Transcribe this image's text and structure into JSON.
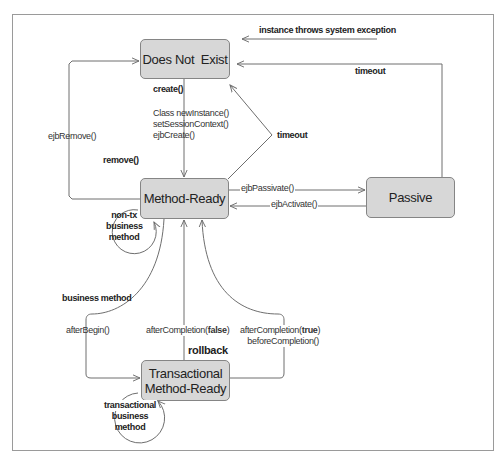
{
  "diagram": {
    "type": "state-diagram",
    "states": {
      "does_not_exist": "Does Not  Exist",
      "method_ready": "Method-Ready",
      "passive": "Passive",
      "transactional_line1": "Transactional",
      "transactional_line2": "Method-Ready"
    },
    "transitions": {
      "system_exception": "instance throws system exception",
      "timeout_passive": "timeout",
      "timeout_ready": "timeout",
      "create": "create()",
      "create_calls": [
        "Class newInstance()",
        "setSessionContext()",
        "ejbCreate()"
      ],
      "ejb_remove": "ejbRemove()",
      "remove": "remove()",
      "ejb_passivate": "ejbPassivate()",
      "ejb_activate": "ejbActivate()",
      "non_tx_loop": [
        "non-tx",
        "business",
        "method"
      ],
      "business_method": "business method",
      "after_begin": "afterBegin()",
      "after_completion_false_prefix": "afterCompletion(",
      "after_completion_false_value": "false",
      "after_completion_false_suffix": ")",
      "rollback": "rollback",
      "after_completion_true_prefix": "afterCompletion(",
      "after_completion_true_value": "true",
      "after_completion_true_suffix": ")",
      "before_completion": "beforeCompletion()",
      "tx_loop": [
        "transactional",
        "business",
        "method"
      ]
    },
    "colors": {
      "state_fill": "#d7d7d7",
      "state_border": "#858585",
      "line": "#6e6e6e",
      "frame": "#9a9a9a"
    }
  }
}
